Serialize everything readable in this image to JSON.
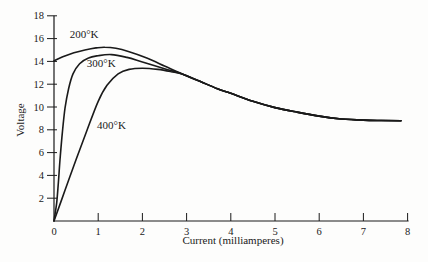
{
  "figure": {
    "background": "#fdfdfc",
    "ink": "#1a1a1a"
  },
  "chart_data": {
    "type": "line",
    "title": "",
    "xlabel": "Current (milliamperes)",
    "ylabel": "Voltage",
    "xlim": [
      0,
      8
    ],
    "ylim": [
      0,
      18
    ],
    "x_ticks": [
      0,
      1,
      2,
      3,
      4,
      5,
      6,
      7,
      8
    ],
    "y_ticks": [
      2,
      4,
      6,
      8,
      10,
      12,
      14,
      16,
      18
    ],
    "grid": false,
    "legend_position": "inline-curve-labels",
    "note": "Three temperature curves merge into a single declining curve near 3 mA",
    "series": [
      {
        "name": "200°K",
        "label_at": {
          "x": 0.68,
          "y": 16.4
        },
        "points": [
          [
            0,
            14.05
          ],
          [
            0.2,
            14.4
          ],
          [
            0.45,
            14.75
          ],
          [
            0.7,
            15.0
          ],
          [
            0.95,
            15.18
          ],
          [
            1.15,
            15.25
          ],
          [
            1.4,
            15.15
          ],
          [
            1.7,
            14.85
          ],
          [
            2.1,
            14.3
          ],
          [
            2.5,
            13.6
          ],
          [
            2.9,
            12.9
          ],
          [
            3.3,
            12.25
          ],
          [
            3.7,
            11.6
          ],
          [
            4.0,
            11.2
          ],
          [
            4.5,
            10.5
          ],
          [
            5.0,
            9.95
          ],
          [
            5.5,
            9.55
          ],
          [
            6.0,
            9.2
          ],
          [
            6.5,
            8.95
          ],
          [
            7.0,
            8.85
          ],
          [
            7.4,
            8.82
          ],
          [
            7.85,
            8.8
          ]
        ]
      },
      {
        "name": "300°K",
        "label_at": {
          "x": 1.07,
          "y": 13.85
        },
        "points": [
          [
            0,
            0
          ],
          [
            0.06,
            1.6
          ],
          [
            0.1,
            3.4
          ],
          [
            0.14,
            5.6
          ],
          [
            0.19,
            7.8
          ],
          [
            0.25,
            9.9
          ],
          [
            0.33,
            11.6
          ],
          [
            0.43,
            12.9
          ],
          [
            0.58,
            13.8
          ],
          [
            0.78,
            14.3
          ],
          [
            1.0,
            14.5
          ],
          [
            1.3,
            14.6
          ],
          [
            1.65,
            14.35
          ],
          [
            2.0,
            13.95
          ],
          [
            2.5,
            13.35
          ],
          [
            2.9,
            12.9
          ],
          [
            3.3,
            12.25
          ],
          [
            3.7,
            11.6
          ],
          [
            4.0,
            11.2
          ],
          [
            4.5,
            10.5
          ],
          [
            5.0,
            9.95
          ],
          [
            5.5,
            9.55
          ],
          [
            6.0,
            9.2
          ],
          [
            6.5,
            8.95
          ],
          [
            7.0,
            8.85
          ],
          [
            7.4,
            8.82
          ],
          [
            7.85,
            8.8
          ]
        ]
      },
      {
        "name": "400°K",
        "label_at": {
          "x": 1.3,
          "y": 8.4
        },
        "points": [
          [
            0,
            0
          ],
          [
            0.25,
            2.7
          ],
          [
            0.5,
            5.4
          ],
          [
            0.75,
            8.0
          ],
          [
            1.0,
            10.5
          ],
          [
            1.2,
            11.9
          ],
          [
            1.45,
            12.9
          ],
          [
            1.7,
            13.3
          ],
          [
            2.0,
            13.4
          ],
          [
            2.35,
            13.3
          ],
          [
            2.65,
            13.1
          ],
          [
            2.9,
            12.9
          ],
          [
            3.3,
            12.25
          ],
          [
            3.7,
            11.6
          ],
          [
            4.0,
            11.2
          ],
          [
            4.5,
            10.5
          ],
          [
            5.0,
            9.95
          ],
          [
            5.5,
            9.55
          ],
          [
            6.0,
            9.2
          ],
          [
            6.5,
            8.95
          ],
          [
            7.0,
            8.85
          ],
          [
            7.4,
            8.82
          ],
          [
            7.85,
            8.8
          ]
        ]
      }
    ]
  }
}
